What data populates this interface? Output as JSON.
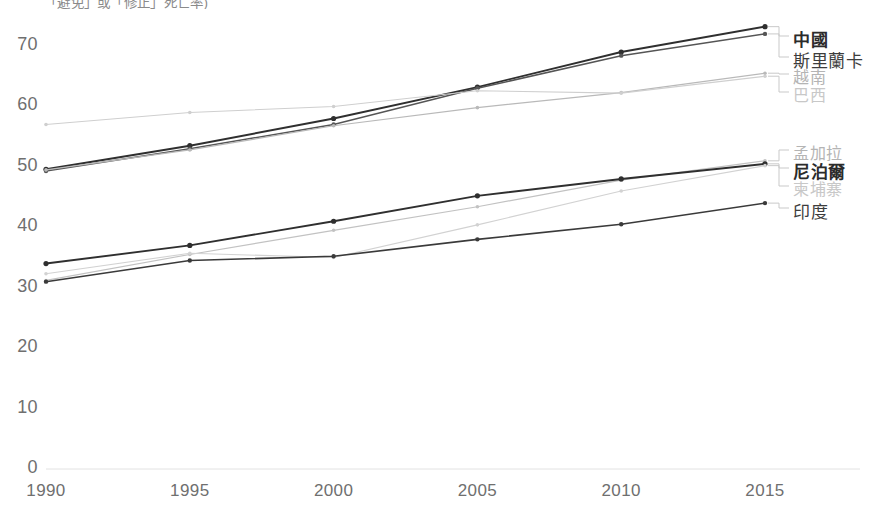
{
  "header": {
    "subtitle_partial": "「避免」或「修正」死亡率)"
  },
  "chart_data": {
    "type": "line",
    "title": "",
    "subtitle": "「避免」或「修正」死亡率)",
    "xlabel": "",
    "ylabel": "",
    "x": [
      1990,
      1995,
      2000,
      2005,
      2010,
      2015
    ],
    "xticklabels": [
      "1990",
      "1995",
      "2000",
      "2005",
      "2010",
      "2015"
    ],
    "yticklabels": [
      "0",
      "10",
      "20",
      "30",
      "40",
      "50",
      "60",
      "70"
    ],
    "yticks": [
      0,
      10,
      20,
      30,
      40,
      50,
      60,
      70
    ],
    "ylim": [
      0,
      75
    ],
    "xlim": [
      1990,
      2015
    ],
    "grid": false,
    "legend_position": "right-of-lines",
    "markers": true,
    "series": [
      {
        "name": "中國",
        "values": [
          49.6,
          53.5,
          58.0,
          63.2,
          69.0,
          73.2
        ],
        "color": "#2f2f2f",
        "width": 1.9,
        "emphasis": "strong",
        "legend_group": "top"
      },
      {
        "name": "斯里蘭卡",
        "values": [
          49.3,
          53.0,
          57.0,
          63.0,
          68.4,
          72.0
        ],
        "color": "#555555",
        "width": 1.5,
        "emphasis": "mid",
        "legend_group": "top"
      },
      {
        "name": "越南",
        "values": [
          49.5,
          52.8,
          56.8,
          59.8,
          62.3,
          65.5
        ],
        "color": "#b9b9b9",
        "width": 1.2,
        "emphasis": "faint",
        "legend_group": "top"
      },
      {
        "name": "巴西",
        "values": [
          57.0,
          59.0,
          60.0,
          62.6,
          62.2,
          65.0
        ],
        "color": "#cfcfcf",
        "width": 1.1,
        "emphasis": "faint2",
        "legend_group": "top"
      },
      {
        "name": "孟加拉",
        "values": [
          31.2,
          35.5,
          39.5,
          43.4,
          47.8,
          51.0
        ],
        "color": "#c2c2c2",
        "width": 1.2,
        "emphasis": "faint",
        "legend_group": "bottom"
      },
      {
        "name": "尼泊爾",
        "values": [
          34.0,
          37.0,
          41.0,
          45.2,
          48.0,
          50.5
        ],
        "color": "#2f2f2f",
        "width": 1.9,
        "emphasis": "strong",
        "legend_group": "bottom"
      },
      {
        "name": "柬埔寨",
        "values": [
          32.3,
          35.7,
          35.0,
          40.4,
          46.0,
          50.2
        ],
        "color": "#d2d2d2",
        "width": 1.1,
        "emphasis": "faint2",
        "legend_group": "bottom"
      },
      {
        "name": "印度",
        "values": [
          31.0,
          34.5,
          35.2,
          38.0,
          40.5,
          44.0
        ],
        "color": "#3a3a3a",
        "width": 1.6,
        "emphasis": "mid",
        "legend_group": "bottom"
      }
    ],
    "legend_top": [
      "中國",
      "斯里蘭卡",
      "越南",
      "巴西"
    ],
    "legend_bottom": [
      "孟加拉",
      "尼泊爾",
      "柬埔寨",
      "印度"
    ],
    "axis_color": "#dcdcdc"
  }
}
